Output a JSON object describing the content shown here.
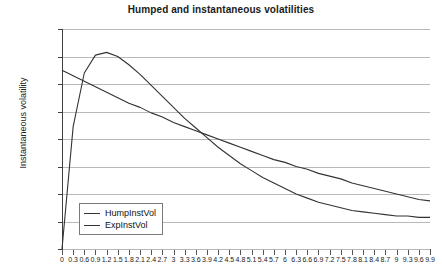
{
  "chart_data": {
    "type": "line",
    "title": "Humped and instantaneous volatilities",
    "xlabel": "",
    "ylabel": "Instantaneous volatility",
    "xlim": [
      0,
      9.9
    ],
    "ylim": [
      0.004,
      0.02
    ],
    "grid": true,
    "legend_position": "bottom-left",
    "y_ticks": [
      "0.004",
      "0.006",
      "0.008",
      "0.01",
      "0.012",
      "0.014",
      "0.016",
      "0.018",
      "0.02"
    ],
    "y_tick_values": [
      0.004,
      0.006,
      0.008,
      0.01,
      0.012,
      0.014,
      0.016,
      0.018,
      0.02
    ],
    "x_ticks": [
      "0",
      "0.3",
      "0.6",
      "0.9",
      "1.2",
      "1.5",
      "1.8",
      "2.1",
      "2.4",
      "2.7",
      "3",
      "3.3",
      "3.6",
      "3.9",
      "4.2",
      "4.5",
      "4.8",
      "5.1",
      "5.4",
      "5.7",
      "6",
      "6.3",
      "6.6",
      "6.9",
      "7.2",
      "7.5",
      "7.8",
      "8.1",
      "8.4",
      "8.7",
      "9",
      "9.3",
      "9.6",
      "9.9"
    ],
    "x": [
      0,
      0.3,
      0.6,
      0.9,
      1.2,
      1.5,
      1.8,
      2.1,
      2.4,
      2.7,
      3,
      3.3,
      3.6,
      3.9,
      4.2,
      4.5,
      4.8,
      5.1,
      5.4,
      5.7,
      6,
      6.3,
      6.6,
      6.9,
      7.2,
      7.5,
      7.8,
      8.1,
      8.4,
      8.7,
      9,
      9.3,
      9.6,
      9.9
    ],
    "series": [
      {
        "name": "HumpInstVol",
        "color": "#333333",
        "values": [
          0.004,
          0.0129,
          0.0168,
          0.0181,
          0.0183,
          0.018,
          0.0174,
          0.0167,
          0.0159,
          0.0151,
          0.0143,
          0.0135,
          0.0128,
          0.0121,
          0.0114,
          0.0108,
          0.0102,
          0.0097,
          0.0092,
          0.0088,
          0.0084,
          0.008,
          0.0077,
          0.0074,
          0.0072,
          0.007,
          0.0068,
          0.0067,
          0.0066,
          0.0065,
          0.0064,
          0.0064,
          0.0063,
          0.0063
        ]
      },
      {
        "name": "ExpInstVol",
        "color": "#333333",
        "values": [
          0.017,
          0.0166,
          0.0162,
          0.0158,
          0.0154,
          0.015,
          0.0146,
          0.0143,
          0.0139,
          0.0136,
          0.0132,
          0.0129,
          0.0126,
          0.0123,
          0.012,
          0.0117,
          0.0114,
          0.0111,
          0.0108,
          0.0105,
          0.0103,
          0.01,
          0.0098,
          0.0095,
          0.0093,
          0.0091,
          0.0088,
          0.0086,
          0.0084,
          0.0082,
          0.008,
          0.0078,
          0.0076,
          0.0075
        ]
      }
    ],
    "legend": [
      "HumpInstVol",
      "ExpInstVol"
    ]
  }
}
